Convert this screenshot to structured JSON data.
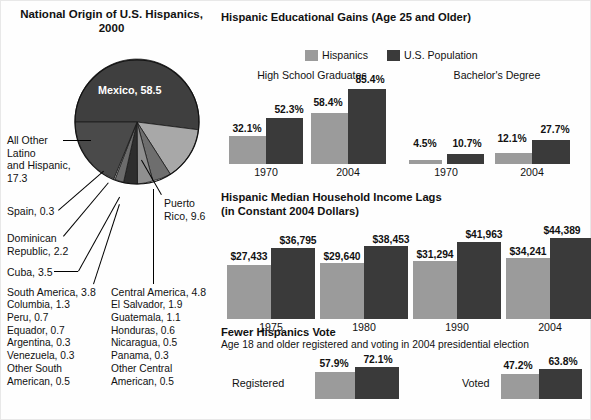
{
  "pie_panel": {
    "title": "National Origin of\nU.S. Hispanics, 2000",
    "slice_labels": {
      "mexico": "Mexico, 58.5",
      "all_other": "All Other\nLatino\nand Hispanic,\n17.3",
      "spain": "Spain, 0.3",
      "dominican": "Dominican\nRepublic, 2.2",
      "cuba": "Cuba, 3.5",
      "puerto_rico": "Puerto\nRico, 9.6",
      "south_america_head": "South America, 3.8",
      "central_america_head": "Central America, 4.8"
    },
    "south_america_items": [
      "Columbia, 1.3",
      "Peru, 0.7",
      "Equador, 0.7",
      "Argentina, 0.3",
      "Venezuela, 0.3",
      "Other South",
      "American, 0.5"
    ],
    "central_america_items": [
      "El Salvador, 1.9",
      "Guatemala, 1.1",
      "Honduras, 0.6",
      "Nicaragua, 0.5",
      "Panama, 0.3",
      "Other Central",
      "American, 0.5"
    ]
  },
  "education": {
    "title": "Hispanic Educational Gains (Age 25 and Older)",
    "legend": [
      {
        "label": "Hispanics",
        "color": "#9b9b9b"
      },
      {
        "label": "U.S. Population",
        "color": "#3a3a3a"
      }
    ],
    "groups": [
      {
        "header": "High School Graduates",
        "years": [
          "1970",
          "2004"
        ]
      },
      {
        "header": "Bachelor's Degree",
        "years": [
          "1970",
          "2004"
        ]
      }
    ],
    "values": {
      "hs_1970_h": "32.1%",
      "hs_1970_u": "52.3%",
      "hs_2004_h": "58.4%",
      "hs_2004_u": "85.4%",
      "ba_1970_h": "4.5%",
      "ba_1970_u": "10.7%",
      "ba_2004_h": "12.1%",
      "ba_2004_u": "27.7%"
    }
  },
  "income": {
    "title": "Hispanic Median Household Income Lags\n(in Constant 2004 Dollars)",
    "years": [
      "1975",
      "1980",
      "1990",
      "2004"
    ],
    "values": {
      "y1975_h": "$27,433",
      "y1975_u": "$36,795",
      "y1980_h": "$29,640",
      "y1980_u": "$38,453",
      "y1990_h": "$31,294",
      "y1990_u": "$41,963",
      "y2004_h": "$34,241",
      "y2004_u": "$44,389"
    }
  },
  "voting": {
    "title": "Fewer Hispanics Vote",
    "subtitle": "Age 18 and older registered and voting in 2004 presidential election",
    "rows": [
      {
        "label": "Registered",
        "hispanic": "57.9%",
        "us": "72.1%"
      },
      {
        "label": "Voted",
        "hispanic": "47.2%",
        "us": "63.8%"
      }
    ]
  },
  "chart_data": [
    {
      "type": "pie",
      "title": "National Origin of U.S. Hispanics, 2000",
      "unit": "percent",
      "categories": [
        "Mexico",
        "All Other Latino and Hispanic",
        "Puerto Rico",
        "Central America",
        "South America",
        "Cuba",
        "Dominican Republic",
        "Spain"
      ],
      "values": [
        58.5,
        17.3,
        9.6,
        4.8,
        3.8,
        3.5,
        2.2,
        0.3
      ],
      "breakdowns": {
        "South America": {
          "total": 3.8,
          "categories": [
            "Columbia",
            "Peru",
            "Equador",
            "Argentina",
            "Venezuela",
            "Other South American"
          ],
          "values": [
            1.3,
            0.7,
            0.7,
            0.3,
            0.3,
            0.5
          ]
        },
        "Central America": {
          "total": 4.8,
          "categories": [
            "El Salvador",
            "Guatemala",
            "Honduras",
            "Nicaragua",
            "Panama",
            "Other Central American"
          ],
          "values": [
            1.9,
            1.1,
            0.6,
            0.5,
            0.3,
            0.5
          ]
        }
      },
      "legend": "labels with leader lines"
    },
    {
      "type": "bar",
      "title": "Hispanic Educational Gains (Age 25 and Older)",
      "ylabel": "percent",
      "categories": [
        "High School Graduates 1970",
        "High School Graduates 2004",
        "Bachelor's Degree 1970",
        "Bachelor's Degree 2004"
      ],
      "series": [
        {
          "name": "Hispanics",
          "color": "#9b9b9b",
          "values": [
            32.1,
            58.4,
            4.5,
            12.1
          ]
        },
        {
          "name": "U.S. Population",
          "color": "#3a3a3a",
          "values": [
            52.3,
            85.4,
            10.7,
            27.7
          ]
        }
      ],
      "ylim": [
        0,
        85.4
      ],
      "grid": false,
      "legend_position": "top"
    },
    {
      "type": "bar",
      "title": "Hispanic Median Household Income Lags (in Constant 2004 Dollars)",
      "ylabel": "2004 dollars",
      "categories": [
        "1975",
        "1980",
        "1990",
        "2004"
      ],
      "series": [
        {
          "name": "Hispanics",
          "color": "#9b9b9b",
          "values": [
            27433,
            29640,
            31294,
            34241
          ]
        },
        {
          "name": "U.S. Population",
          "color": "#3a3a3a",
          "values": [
            36795,
            38453,
            41963,
            44389
          ]
        }
      ],
      "ylim": [
        0,
        44389
      ],
      "grid": false,
      "legend_position": "none"
    },
    {
      "type": "bar",
      "title": "Fewer Hispanics Vote",
      "subtitle": "Age 18 and older registered and voting in 2004 presidential election",
      "ylabel": "percent",
      "categories": [
        "Registered",
        "Voted"
      ],
      "series": [
        {
          "name": "Hispanics",
          "color": "#9b9b9b",
          "values": [
            57.9,
            47.2
          ]
        },
        {
          "name": "U.S. Population",
          "color": "#3a3a3a",
          "values": [
            72.1,
            63.8
          ]
        }
      ],
      "ylim": [
        0,
        100
      ],
      "grid": false,
      "legend_position": "none",
      "orientation": "horizontal-pair"
    }
  ]
}
